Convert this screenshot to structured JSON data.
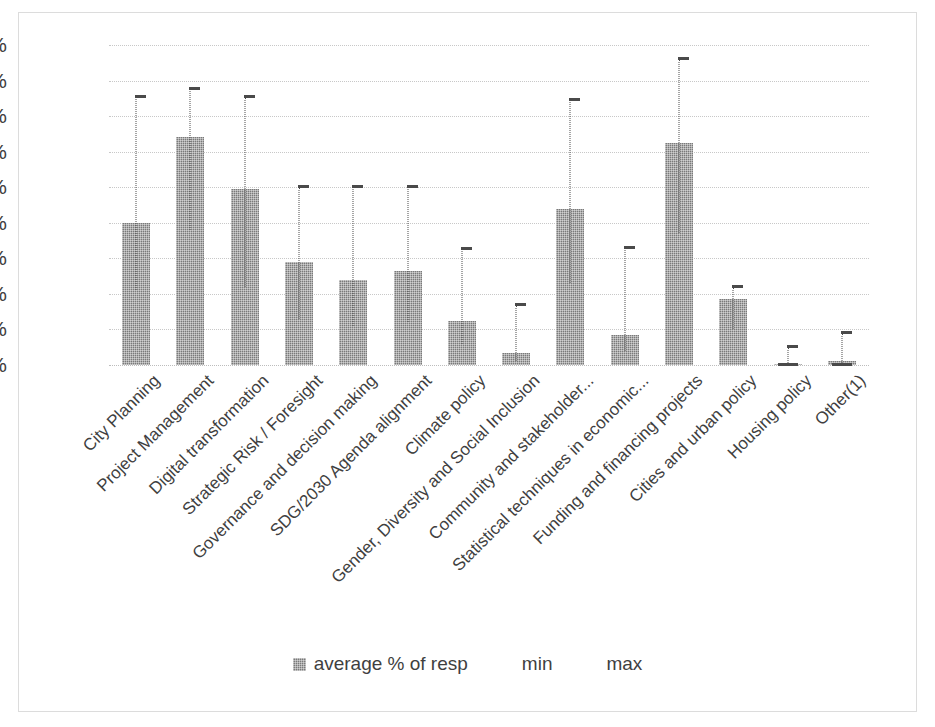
{
  "chart_data": {
    "type": "bar",
    "title": "",
    "subtitle": "",
    "xlabel": "",
    "ylabel": "",
    "ylim": [
      0,
      90
    ],
    "ytick_step": 10,
    "grid": true,
    "y_axis_duplicated_right": true,
    "legend_position": "bottom",
    "ytick_labels": [
      "90%",
      "80%",
      "70%",
      "60%",
      "50%",
      "40%",
      "30%",
      "20%",
      "10%",
      "0%"
    ],
    "categories": [
      "City Planning",
      "Project Management",
      "Digital transformation",
      "Strategic Risk / Foresight",
      "Governance and decision making",
      "SDG/2030 Agenda alignment",
      "Climate policy",
      "Gender, Diversity and Social Inclusion",
      "Community and stakeholder...",
      "Statistical techniques in economic...",
      "Funding and financing projects",
      "Cities and urban policy",
      "Housing policy",
      "Other(1)"
    ],
    "series": [
      {
        "name": "average % of resp",
        "type": "bar",
        "values": [
          40,
          64,
          49.5,
          29,
          24,
          26.5,
          12.5,
          3.5,
          44,
          8.5,
          62.5,
          18.5,
          0.3,
          1
        ]
      },
      {
        "name": "min",
        "type": "errorbar-lower",
        "values": [
          21,
          38,
          22,
          13,
          11,
          12,
          6,
          1,
          23,
          4,
          37,
          10,
          0,
          0
        ]
      },
      {
        "name": "max",
        "type": "errorbar-upper",
        "values": [
          75.5,
          77.5,
          75.5,
          50,
          50,
          50,
          32.5,
          17,
          74.5,
          33,
          86,
          22,
          5,
          9
        ]
      }
    ],
    "colors": {
      "bar_fill": "#7a7a7a",
      "error_bar": "#4a4a4a",
      "gridline": "#c8c8c8",
      "text": "#3f3f3f",
      "frame_border": "#dcdcdc",
      "background": "#ffffff"
    }
  },
  "legend": {
    "items": [
      {
        "label": "average % of resp",
        "swatch": true
      },
      {
        "label": "min",
        "swatch": false
      },
      {
        "label": "max",
        "swatch": false
      }
    ]
  }
}
